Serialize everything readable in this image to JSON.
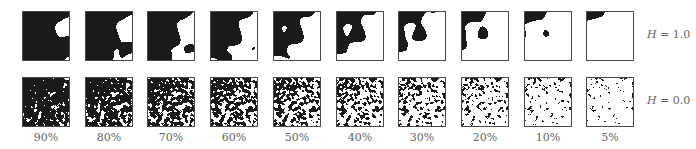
{
  "figure": {
    "rows": [
      {
        "id": "h1",
        "label_var": "H",
        "label_rest": " = 1.0",
        "hurst": 1.0,
        "top": 11,
        "smooth": true
      },
      {
        "id": "h0",
        "label_var": "H",
        "label_rest": " = 0.0",
        "hurst": 0.0,
        "top": 77,
        "smooth": false
      }
    ],
    "columns": [
      {
        "label": "90%",
        "fraction": 0.9
      },
      {
        "label": "80%",
        "fraction": 0.8
      },
      {
        "label": "70%",
        "fraction": 0.7
      },
      {
        "label": "60%",
        "fraction": 0.6
      },
      {
        "label": "50%",
        "fraction": 0.5
      },
      {
        "label": "40%",
        "fraction": 0.4
      },
      {
        "label": "30%",
        "fraction": 0.3
      },
      {
        "label": "20%",
        "fraction": 0.2
      },
      {
        "label": "10%",
        "fraction": 0.1
      },
      {
        "label": "5%",
        "fraction": 0.05
      }
    ],
    "layout": {
      "first_left": 22,
      "pitch": 62.7,
      "row_label_left": 647
    },
    "colors": {
      "filled": "#1a1a1a",
      "empty": "#ffffff",
      "border": "#4a4a4a"
    }
  }
}
